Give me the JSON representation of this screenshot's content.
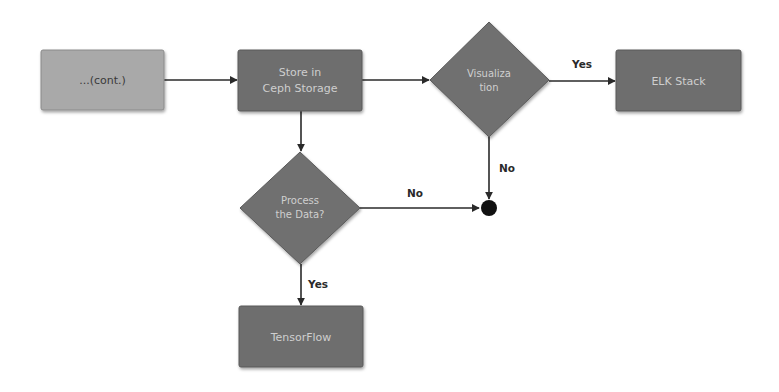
{
  "diagram": {
    "type": "flowchart",
    "colors": {
      "background": "#ffffff",
      "start_box_fill": "#a9a9a9",
      "box_fill": "#6e6e6e",
      "diamond_fill": "#707070",
      "box_stroke": "#5a5a5a",
      "node_text": "#cfcfcf",
      "start_text": "#3a3a3a",
      "edge": "#2a2a2a",
      "junction": "#111111"
    },
    "nodes": {
      "cont": {
        "label": "...(cont.)",
        "shape": "rect"
      },
      "ceph": {
        "label_line1": "Store in",
        "label_line2": "Ceph Storage",
        "shape": "rect"
      },
      "visualization": {
        "label_line1": "Visualiza",
        "label_line2": "tion",
        "shape": "diamond"
      },
      "elk": {
        "label": "ELK Stack",
        "shape": "rect"
      },
      "process": {
        "label_line1": "Process",
        "label_line2": "the Data?",
        "shape": "diamond"
      },
      "tensorflow": {
        "label": "TensorFlow",
        "shape": "rect"
      },
      "junction": {
        "shape": "circle"
      }
    },
    "edges": [
      {
        "from": "cont",
        "to": "ceph",
        "label": ""
      },
      {
        "from": "ceph",
        "to": "visualization",
        "label": ""
      },
      {
        "from": "visualization",
        "to": "elk",
        "label": "Yes"
      },
      {
        "from": "visualization",
        "to": "junction",
        "label": "No"
      },
      {
        "from": "ceph",
        "to": "process",
        "label": ""
      },
      {
        "from": "process",
        "to": "junction",
        "label": "No"
      },
      {
        "from": "process",
        "to": "tensorflow",
        "label": "Yes"
      }
    ],
    "edge_labels": {
      "vis_yes": "Yes",
      "vis_no": "No",
      "process_no": "No",
      "process_yes": "Yes"
    }
  }
}
